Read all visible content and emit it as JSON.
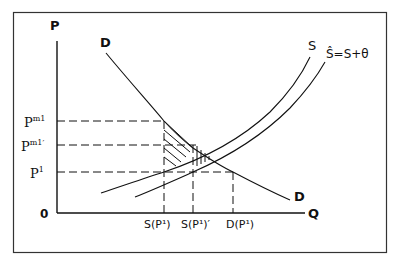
{
  "diagram": {
    "axes": {
      "y_label": "P",
      "x_label": "Q",
      "origin_label": "0"
    },
    "curves": {
      "demand_top_label": "D",
      "demand_bottom_label": "D",
      "supply_label": "S",
      "supply_shifted_label": "Ŝ=S+θ"
    },
    "price_levels": [
      {
        "name": "pm1",
        "label_base": "P",
        "label_sup": "m1"
      },
      {
        "name": "pm1-prime",
        "label_base": "P",
        "label_sup": "m1′"
      },
      {
        "name": "p1",
        "label_base": "P",
        "label_sup": "1"
      }
    ],
    "quantity_levels": [
      {
        "name": "s-p1",
        "label": "S(P¹)"
      },
      {
        "name": "s-p1-prime",
        "label": "S(P¹)′"
      },
      {
        "name": "d-p1",
        "label": "D(P¹)"
      }
    ],
    "colors": {
      "line": "#111111",
      "frame": "#333333",
      "background": "#ffffff"
    }
  }
}
